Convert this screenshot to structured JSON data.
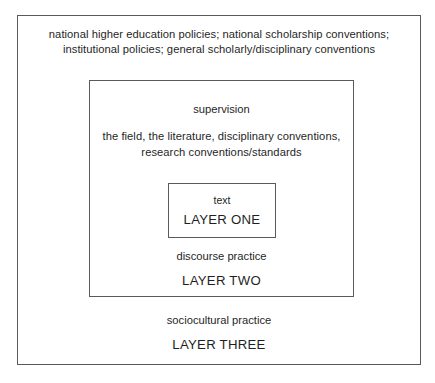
{
  "diagram": {
    "layers": {
      "outer": {
        "context_line_1": "national higher education policies; national scholarship conventions;",
        "context_line_2": "institutional policies; general scholarly/disciplinary conventions",
        "practice_label": "sociocultural practice",
        "title": "LAYER THREE"
      },
      "middle": {
        "lead_label": "supervision",
        "context_line_1": "the field, the literature, disciplinary conventions,",
        "context_line_2": "research conventions/standards",
        "practice_label": "discourse practice",
        "title": "LAYER TWO"
      },
      "inner": {
        "lead_label": "text",
        "title": "LAYER ONE"
      }
    },
    "colors": {
      "border": "#5a5a5a",
      "text": "#1f1f1f",
      "background": "#ffffff"
    }
  }
}
